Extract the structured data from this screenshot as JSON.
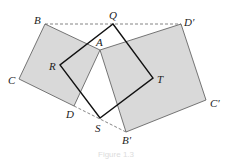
{
  "figure": {
    "colors": {
      "fill": "#d9d9d9",
      "stroke": "#333333",
      "dashed": "#555555",
      "inner_square": "#111111"
    },
    "points": {
      "B": [
        45,
        24
      ],
      "A": [
        100,
        50
      ],
      "D": [
        74,
        106
      ],
      "C": [
        19,
        79
      ],
      "Dp": [
        181,
        24
      ],
      "Cp": [
        206,
        100
      ],
      "Bp": [
        126,
        132
      ],
      "Q": [
        113,
        24
      ],
      "T": [
        153,
        78
      ],
      "S": [
        100,
        118
      ],
      "R": [
        60,
        65
      ]
    },
    "labels": {
      "B": "B",
      "Q": "Q",
      "Dp": "D′",
      "A": "A",
      "R": "R",
      "T": "T",
      "C": "C",
      "Cp": "C′",
      "D": "D",
      "S": "S",
      "Bp": "B′"
    },
    "caption": "Figure 1.3"
  }
}
